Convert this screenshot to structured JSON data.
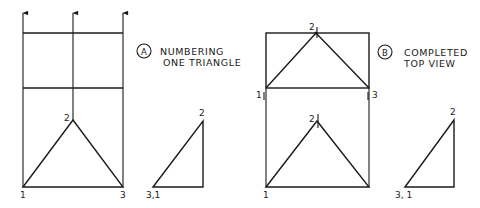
{
  "figure_a": {
    "badge": "A",
    "caption_line1": "NUMBERING",
    "caption_line2": "ONE TRIANGLE",
    "front_view_labels": {
      "v1": "1",
      "v2": "2",
      "v3": "3"
    },
    "side_view_labels": {
      "v2": "2",
      "v31": "3,1"
    }
  },
  "figure_b": {
    "badge": "B",
    "caption_line1": "COMPLETED",
    "caption_line2": "TOP VIEW",
    "top_view_labels": {
      "v1": "1",
      "v2": "2",
      "v3": "3"
    },
    "front_view_labels": {
      "v1": "1",
      "v2": "2"
    },
    "side_view_labels": {
      "v2": "2",
      "v31": "3, 1"
    }
  },
  "colors": {
    "ink": "#1a1a1a",
    "paper": "#ffffff"
  }
}
